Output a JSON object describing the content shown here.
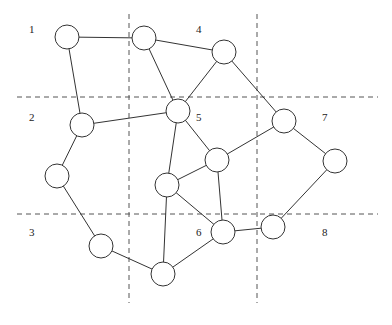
{
  "diagram": {
    "type": "graph-partition",
    "colors": {
      "line": "#333333",
      "grid": "#555555",
      "node_fill": "#ffffff",
      "background": "#ffffff"
    },
    "grid": {
      "vertical": [
        {
          "x": 129,
          "y1": 14,
          "y2": 303
        },
        {
          "x": 257,
          "y1": 14,
          "y2": 303
        }
      ],
      "horizontal": [
        {
          "y": 97,
          "x1": 17,
          "x2": 378
        },
        {
          "y": 214,
          "x1": 17,
          "x2": 378
        }
      ]
    },
    "regions": [
      {
        "label": "1",
        "x": 29,
        "y": 33
      },
      {
        "label": "2",
        "x": 29,
        "y": 121
      },
      {
        "label": "3",
        "x": 29,
        "y": 236
      },
      {
        "label": "4",
        "x": 196,
        "y": 33
      },
      {
        "label": "5",
        "x": 196,
        "y": 121
      },
      {
        "label": "6",
        "x": 196,
        "y": 236
      },
      {
        "label": "7",
        "x": 322,
        "y": 121
      },
      {
        "label": "8",
        "x": 322,
        "y": 236
      }
    ],
    "node_radius": 12,
    "nodes": [
      {
        "id": "A",
        "x": 67,
        "y": 37
      },
      {
        "id": "B",
        "x": 144,
        "y": 38
      },
      {
        "id": "C",
        "x": 224,
        "y": 52
      },
      {
        "id": "D",
        "x": 178,
        "y": 111
      },
      {
        "id": "E",
        "x": 82,
        "y": 125
      },
      {
        "id": "F",
        "x": 284,
        "y": 121
      },
      {
        "id": "G",
        "x": 57,
        "y": 176
      },
      {
        "id": "H",
        "x": 217,
        "y": 160
      },
      {
        "id": "I",
        "x": 335,
        "y": 161
      },
      {
        "id": "J",
        "x": 167,
        "y": 185
      },
      {
        "id": "K",
        "x": 101,
        "y": 246
      },
      {
        "id": "L",
        "x": 223,
        "y": 232
      },
      {
        "id": "M",
        "x": 273,
        "y": 227
      },
      {
        "id": "N",
        "x": 163,
        "y": 274
      }
    ],
    "edges": [
      [
        "A",
        "B"
      ],
      [
        "A",
        "E"
      ],
      [
        "B",
        "C"
      ],
      [
        "B",
        "D"
      ],
      [
        "C",
        "D"
      ],
      [
        "C",
        "F"
      ],
      [
        "D",
        "E"
      ],
      [
        "D",
        "H"
      ],
      [
        "D",
        "J"
      ],
      [
        "E",
        "G"
      ],
      [
        "G",
        "K"
      ],
      [
        "K",
        "N"
      ],
      [
        "N",
        "J"
      ],
      [
        "N",
        "L"
      ],
      [
        "J",
        "H"
      ],
      [
        "J",
        "L"
      ],
      [
        "H",
        "L"
      ],
      [
        "H",
        "F"
      ],
      [
        "F",
        "I"
      ],
      [
        "I",
        "M"
      ],
      [
        "L",
        "M"
      ]
    ]
  }
}
